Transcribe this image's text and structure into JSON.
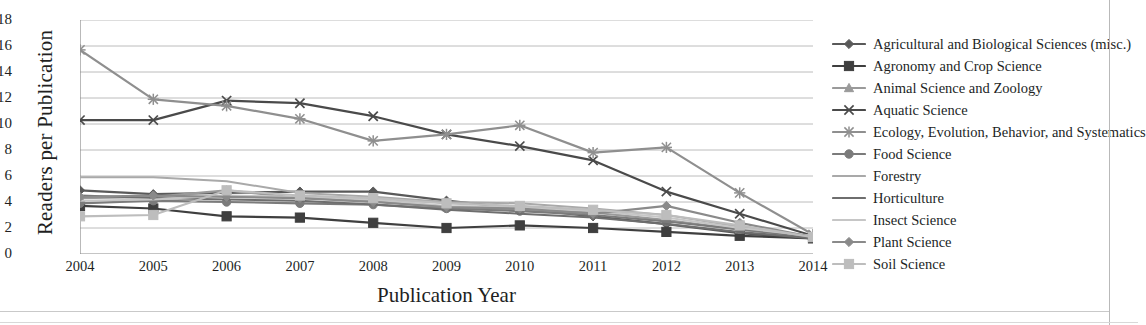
{
  "chart_data": {
    "type": "line",
    "title": "",
    "xlabel": "Publication Year",
    "ylabel": "Readers per Publication",
    "x": [
      2004,
      2005,
      2006,
      2007,
      2008,
      2009,
      2010,
      2011,
      2012,
      2013,
      2014
    ],
    "xtick_labels": [
      "2004",
      "2005",
      "2006",
      "2007",
      "2008",
      "2009",
      "2010",
      "2011",
      "2012",
      "2013",
      "2014"
    ],
    "ytick_labels": [
      "0",
      "2",
      "4",
      "6",
      "8",
      "10",
      "12",
      "14",
      "16",
      "18"
    ],
    "ylim": [
      0,
      18
    ],
    "ystep": 2,
    "grid": "horizontal",
    "legend_position": "right",
    "series": [
      {
        "name": "Agricultural and Biological Sciences (misc.)",
        "marker": "diamond",
        "color": "#595959",
        "values": [
          4.9,
          4.6,
          4.7,
          4.8,
          4.8,
          4.1,
          3.5,
          2.9,
          2.3,
          1.6,
          1.2
        ]
      },
      {
        "name": "Agronomy and Crop Science",
        "marker": "square",
        "color": "#3f3f3f",
        "values": [
          3.7,
          3.5,
          2.9,
          2.8,
          2.4,
          2.0,
          2.2,
          2.0,
          1.7,
          1.4,
          1.2
        ]
      },
      {
        "name": "Animal Science and Zoology",
        "marker": "triangle",
        "color": "#9a9a9a",
        "values": [
          4.3,
          4.4,
          4.9,
          4.3,
          4.1,
          3.6,
          3.4,
          3.2,
          2.6,
          1.9,
          1.3
        ]
      },
      {
        "name": "Aquatic Science",
        "marker": "x",
        "color": "#4a4a4a",
        "values": [
          10.3,
          10.3,
          11.8,
          11.6,
          10.6,
          9.2,
          8.3,
          7.2,
          4.8,
          3.1,
          1.4
        ]
      },
      {
        "name": "Ecology, Evolution, Behavior, and Systematics",
        "marker": "star",
        "color": "#8f8f8f",
        "values": [
          15.7,
          11.9,
          11.4,
          10.4,
          8.7,
          9.2,
          9.9,
          7.8,
          8.2,
          4.7,
          1.5
        ]
      },
      {
        "name": "Food Science",
        "marker": "circle",
        "color": "#7b7b7b",
        "values": [
          3.9,
          4.1,
          4.0,
          3.9,
          3.8,
          3.5,
          3.3,
          3.0,
          2.5,
          1.9,
          1.3
        ]
      },
      {
        "name": "Forestry",
        "marker": "none",
        "color": "#a9a9a9",
        "values": [
          5.9,
          5.9,
          5.6,
          4.7,
          4.4,
          4.0,
          3.9,
          3.5,
          3.0,
          2.1,
          1.3
        ]
      },
      {
        "name": "Horticulture",
        "marker": "none",
        "color": "#6e6e6e",
        "values": [
          4.5,
          4.3,
          4.2,
          4.1,
          3.8,
          3.4,
          3.1,
          2.8,
          2.3,
          1.7,
          1.2
        ]
      },
      {
        "name": "Insect Science",
        "marker": "none",
        "color": "#c6c6c6",
        "values": [
          4.1,
          4.2,
          4.5,
          4.4,
          4.2,
          3.7,
          3.6,
          3.3,
          2.8,
          2.0,
          1.4
        ]
      },
      {
        "name": "Plant Science",
        "marker": "diamond",
        "color": "#8a8a8a",
        "values": [
          4.4,
          4.5,
          4.4,
          4.3,
          4.0,
          3.6,
          3.5,
          3.1,
          3.7,
          2.4,
          1.3
        ]
      },
      {
        "name": "Soil Science",
        "marker": "square",
        "color": "#bdbdbd",
        "values": [
          2.9,
          3.0,
          4.9,
          4.5,
          4.3,
          3.9,
          3.7,
          3.4,
          3.0,
          2.2,
          1.3
        ]
      }
    ]
  },
  "axes": {
    "ylabel": "Readers per Publication",
    "xlabel": "Publication Year"
  },
  "legend": {
    "items": [
      {
        "label": "Agricultural and Biological Sciences (misc.)"
      },
      {
        "label": "Agronomy and Crop Science"
      },
      {
        "label": "Animal Science and Zoology"
      },
      {
        "label": "Aquatic Science"
      },
      {
        "label": "Ecology, Evolution, Behavior, and Systematics"
      },
      {
        "label": "Food Science"
      },
      {
        "label": "Forestry"
      },
      {
        "label": "Horticulture"
      },
      {
        "label": "Insect Science"
      },
      {
        "label": "Plant Science"
      },
      {
        "label": "Soil Science"
      }
    ]
  }
}
